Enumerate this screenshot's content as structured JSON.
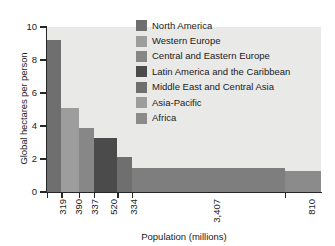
{
  "chart_data": {
    "type": "bar",
    "title": "",
    "xlabel": "Population (millions)",
    "ylabel": "Global hectares per person",
    "ylim": [
      0,
      10
    ],
    "yticks": [
      0,
      2,
      4,
      6,
      8,
      10
    ],
    "grid": false,
    "legend_position": "top-right",
    "note": "Bar width is proportional to population (millions); bar height is ecological footprint in global hectares per person.",
    "categories": [
      "North America",
      "Western Europe",
      "Central and Eastern Europe",
      "Latin America and the Caribbean",
      "Middle East and Central Asia",
      "Asia-Pacific",
      "Africa"
    ],
    "x_tick_labels": [
      "319",
      "390",
      "337",
      "520",
      "334",
      "3,407",
      "810"
    ],
    "populations": [
      319,
      390,
      337,
      520,
      334,
      3407,
      810
    ],
    "values": [
      9.2,
      5.1,
      3.85,
      3.3,
      2.15,
      1.45,
      1.3
    ],
    "colors": [
      "#6f6f6f",
      "#9d9d9d",
      "#878787",
      "#4b4b4b",
      "#6f6f6f",
      "#7e7e7e",
      "#8b8b8b"
    ],
    "plot_background": "#e9e9e7",
    "axis_color": "#262626"
  },
  "legend": {
    "items": [
      {
        "label": "North America",
        "color": "#6f6f6f"
      },
      {
        "label": "Western Europe",
        "color": "#9d9d9d"
      },
      {
        "label": "Central and Eastern Europe",
        "color": "#878787"
      },
      {
        "label": "Latin America and the Caribbean",
        "color": "#4b4b4b"
      },
      {
        "label": "Middle East and Central Asia",
        "color": "#6f6f6f"
      },
      {
        "label": "Asia-Pacific",
        "color": "#9d9d9d"
      },
      {
        "label": "Africa",
        "color": "#8b8b8b"
      }
    ]
  },
  "axes": {
    "y_title": "Global hectares per person",
    "x_title": "Population (millions)",
    "y_tick_labels": [
      "0",
      "2",
      "4",
      "6",
      "8",
      "10"
    ]
  }
}
